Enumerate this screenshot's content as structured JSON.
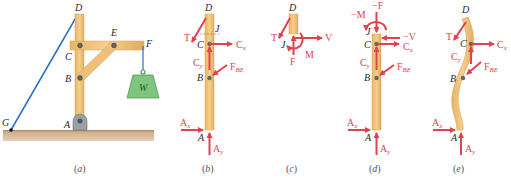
{
  "figure": {
    "colors": {
      "wood": "#f0c27a",
      "wood_edge": "#d9a453",
      "ground": "#c9a27e",
      "cable": "#2a6fc6",
      "force": "#e0424f",
      "weight_fill": "#7fc47f",
      "weight_edge": "#4f9a55",
      "pin": "#555555",
      "point_label": "#2a2a2a"
    },
    "panels": [
      {
        "id": "a",
        "caption_open": "(",
        "caption_letter": "a",
        "caption_close": ")",
        "points": {
          "D": "D",
          "E": "E",
          "F": "F",
          "C": "C",
          "B": "B",
          "A": "A",
          "G": "G"
        },
        "weight_label": "W"
      },
      {
        "id": "b",
        "caption_open": "(",
        "caption_letter": "b",
        "caption_close": ")",
        "points": {
          "D": "D",
          "J": "J",
          "C": "C",
          "B": "B",
          "A": "A"
        },
        "forces": {
          "T": "T",
          "Cx": "C",
          "Cx_sub": "x",
          "Cy": "C",
          "Cy_sub": "y",
          "FBE": "F",
          "FBE_sub": "BE",
          "Ax": "A",
          "Ax_sub": "x",
          "Ay": "A",
          "Ay_sub": "y"
        }
      },
      {
        "id": "c",
        "caption_open": "(",
        "caption_letter": "c",
        "caption_close": ")",
        "points": {
          "D": "D",
          "J": "J"
        },
        "forces": {
          "T": "T",
          "V": "V",
          "M": "M",
          "F": "F"
        }
      },
      {
        "id": "d",
        "caption_open": "(",
        "caption_letter": "d",
        "caption_close": ")",
        "points": {
          "J": "J",
          "C": "C",
          "B": "B",
          "A": "A"
        },
        "forces": {
          "negM": "−M",
          "negF": "−F",
          "negV": "−V",
          "Cx": "C",
          "Cx_sub": "x",
          "Cy": "C",
          "Cy_sub": "y",
          "FBE": "F",
          "FBE_sub": "BE",
          "Ax": "A",
          "Ax_sub": "x",
          "Ay": "A",
          "Ay_sub": "y"
        }
      },
      {
        "id": "e",
        "caption_open": "(",
        "caption_letter": "e",
        "caption_close": ")",
        "points": {
          "D": "D",
          "C": "C",
          "B": "B",
          "A": "A"
        },
        "forces": {
          "T": "T",
          "Cx": "C",
          "Cx_sub": "x",
          "Cy": "C",
          "Cy_sub": "y",
          "FBE": "F",
          "FBE_sub": "BE",
          "Ax": "A",
          "Ax_sub": "x",
          "Ay": "A",
          "Ay_sub": "y"
        }
      }
    ]
  }
}
